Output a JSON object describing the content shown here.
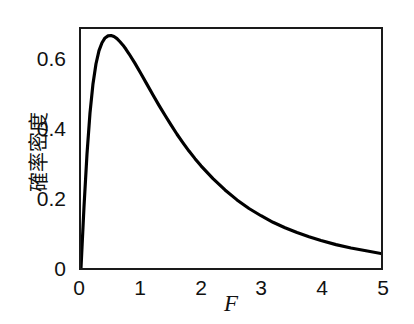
{
  "chart_data": {
    "type": "line",
    "title": "",
    "xlabel": "F",
    "ylabel": "確率密度",
    "xlim": [
      0,
      5
    ],
    "ylim": [
      0,
      0.695
    ],
    "xticks": [
      "0",
      "1",
      "2",
      "3",
      "4",
      "5"
    ],
    "xtick_values": [
      0,
      1,
      2,
      3,
      4,
      5
    ],
    "yticks": [
      "0",
      "0.2",
      "0.4",
      "0.6"
    ],
    "ytick_values": [
      0,
      0.2,
      0.4,
      0.6
    ],
    "grid": false,
    "legend": "none",
    "line_color": "#000000",
    "line_width": 3,
    "background_color": "#ffffff",
    "frame_color": "#1a1a1a",
    "series": [
      {
        "name": "probability density",
        "x": [
          0.0,
          0.05,
          0.1,
          0.15,
          0.2,
          0.25,
          0.3,
          0.35,
          0.4,
          0.45,
          0.5,
          0.55,
          0.6,
          0.65,
          0.7,
          0.75,
          0.8,
          0.9,
          1.0,
          1.1,
          1.2,
          1.3,
          1.4,
          1.5,
          1.6,
          1.7,
          1.8,
          1.9,
          2.0,
          2.2,
          2.4,
          2.6,
          2.8,
          3.0,
          3.2,
          3.4,
          3.6,
          3.8,
          4.0,
          4.25,
          4.5,
          4.75,
          5.0
        ],
        "y": [
          0.0,
          0.178,
          0.332,
          0.451,
          0.536,
          0.594,
          0.632,
          0.655,
          0.669,
          0.675,
          0.676,
          0.673,
          0.667,
          0.658,
          0.648,
          0.636,
          0.623,
          0.595,
          0.565,
          0.534,
          0.503,
          0.473,
          0.444,
          0.416,
          0.389,
          0.364,
          0.34,
          0.318,
          0.297,
          0.26,
          0.227,
          0.198,
          0.173,
          0.152,
          0.133,
          0.117,
          0.103,
          0.091,
          0.08,
          0.068,
          0.058,
          0.05,
          0.042
        ]
      }
    ]
  },
  "axes": {
    "x_tick_labels": [
      {
        "text": "0",
        "value": 0
      },
      {
        "text": "1",
        "value": 1
      },
      {
        "text": "2",
        "value": 2
      },
      {
        "text": "3",
        "value": 3
      },
      {
        "text": "4",
        "value": 4
      },
      {
        "text": "5",
        "value": 5
      }
    ],
    "y_tick_labels": [
      {
        "text": "0",
        "value": 0
      },
      {
        "text": "0.2",
        "value": 0.2
      },
      {
        "text": "0.4",
        "value": 0.4
      },
      {
        "text": "0.6",
        "value": 0.6
      }
    ],
    "x_title": "F",
    "y_title": "確率密度"
  }
}
